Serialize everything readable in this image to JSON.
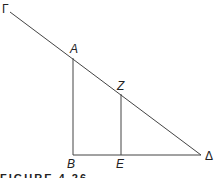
{
  "figure": {
    "caption": "FIGURE 4.26",
    "labels": {
      "gamma": "Γ",
      "a": "A",
      "z": "Z",
      "b": "B",
      "e": "E",
      "delta": "Δ"
    },
    "line_color": "#444444"
  }
}
